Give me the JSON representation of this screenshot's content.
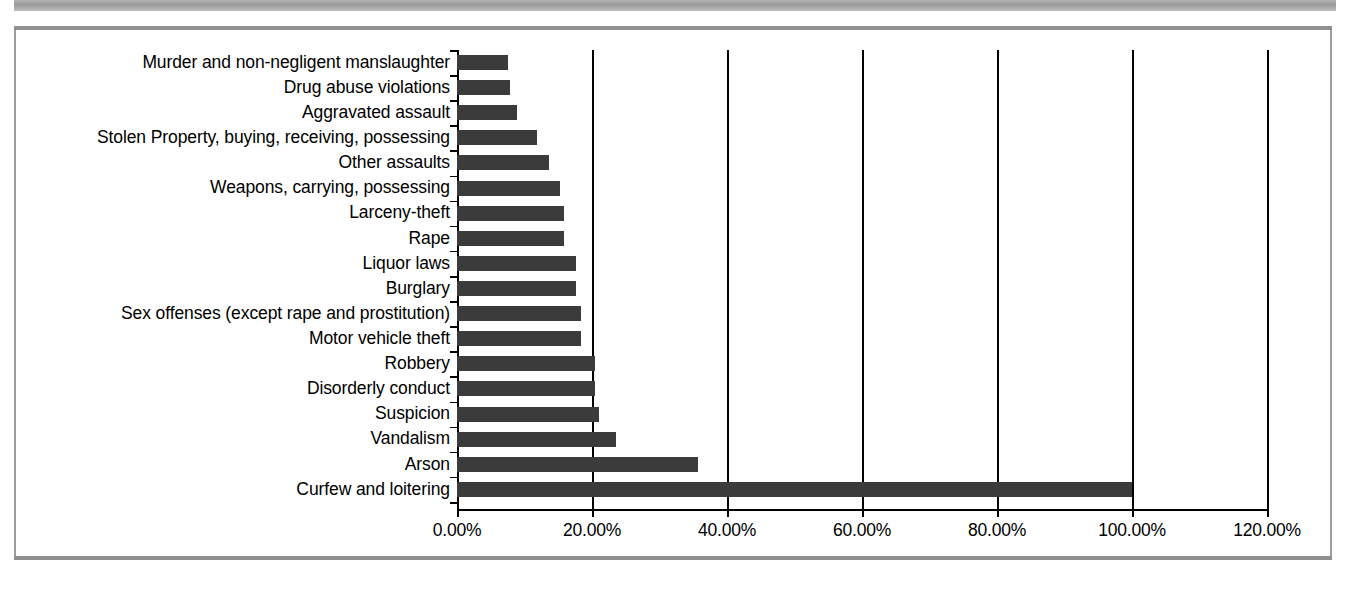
{
  "chart_data": {
    "type": "bar",
    "orientation": "horizontal",
    "title": "",
    "subtitle": "",
    "xlabel": "",
    "ylabel": "",
    "xlim": [
      0,
      120
    ],
    "xtick_labels": [
      "0.00%",
      "20.00%",
      "40.00%",
      "60.00%",
      "80.00%",
      "100.00%",
      "120.00%"
    ],
    "xtick_values": [
      0,
      20,
      40,
      60,
      80,
      100,
      120
    ],
    "grid": true,
    "legend": false,
    "legend_position": "none",
    "bar_color": "#3b3b3b",
    "axis_color": "#000000",
    "categories": [
      "Murder and non-negligent manslaughter",
      "Drug abuse violations",
      "Aggravated assault",
      "Stolen Property, buying, receiving, possessing",
      "Other assaults",
      "Weapons, carrying, possessing",
      "Larceny-theft",
      "Rape",
      "Liquor laws",
      "Burglary",
      "Sex offenses (except rape and prostitution)",
      "Motor vehicle theft",
      "Robbery",
      "Disorderly conduct",
      "Suspicion",
      "Vandalism",
      "Arson",
      "Curfew and loitering"
    ],
    "values": [
      7.6,
      7.9,
      8.9,
      11.8,
      13.7,
      15.3,
      15.8,
      15.9,
      17.6,
      17.6,
      18.3,
      18.3,
      20.4,
      20.4,
      21.0,
      23.5,
      35.7,
      100.0
    ]
  }
}
